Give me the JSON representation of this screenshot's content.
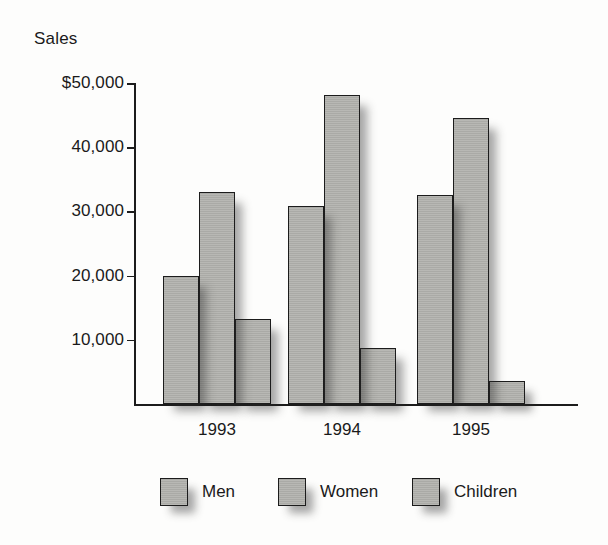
{
  "chart_data": {
    "type": "bar",
    "title": "",
    "ylabel": "Sales",
    "xlabel": "",
    "categories": [
      "1993",
      "1994",
      "1995"
    ],
    "series": [
      {
        "name": "Men",
        "values": [
          20000,
          30800,
          32500
        ]
      },
      {
        "name": "Women",
        "values": [
          33000,
          48200,
          44600
        ]
      },
      {
        "name": "Children",
        "values": [
          13300,
          8800,
          3600
        ]
      }
    ],
    "ylim": [
      0,
      50000
    ],
    "ytick_values": [
      10000,
      20000,
      30000,
      40000,
      50000
    ],
    "ytick_labels": [
      "10,000",
      "20,000",
      "30,000",
      "40,000",
      "$50,000"
    ],
    "grid": false,
    "legend_position": "bottom",
    "bar_fill_color": "#b0b0ac",
    "bar_border_color": "#1c1c1c",
    "axis_color": "#1c1c1c",
    "background_color": "#fdfdfc"
  }
}
